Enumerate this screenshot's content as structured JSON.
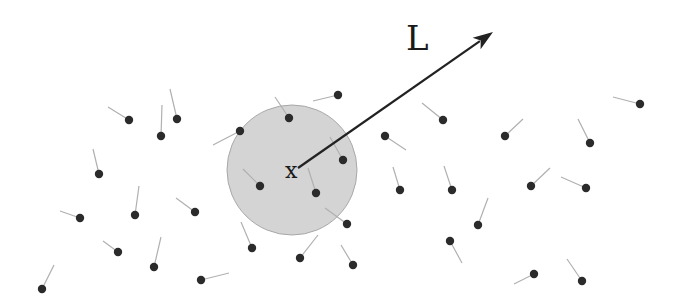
{
  "diagram": {
    "labels": {
      "vector": "L",
      "center": "x"
    },
    "colors": {
      "background": "#ffffff",
      "region_fill": "#d4d4d4",
      "region_stroke": "#a8a8a8",
      "particle": "#2b2b2b",
      "tail": "#b0b0b0",
      "arrow": "#222222"
    },
    "region": {
      "cx": 292,
      "cy": 170,
      "r": 65
    },
    "arrow": {
      "x1": 298,
      "y1": 168,
      "x2": 493,
      "y2": 32
    },
    "particles": [
      {
        "x": 129,
        "y": 120,
        "tx": 108,
        "ty": 107
      },
      {
        "x": 161,
        "y": 136,
        "tx": 162,
        "ty": 105
      },
      {
        "x": 177,
        "y": 119,
        "tx": 170,
        "ty": 89
      },
      {
        "x": 99,
        "y": 174,
        "tx": 93,
        "ty": 149
      },
      {
        "x": 80,
        "y": 218,
        "tx": 60,
        "ty": 211
      },
      {
        "x": 135,
        "y": 215,
        "tx": 139,
        "ty": 186
      },
      {
        "x": 195,
        "y": 212,
        "tx": 176,
        "ty": 198
      },
      {
        "x": 118,
        "y": 252,
        "tx": 103,
        "ty": 241
      },
      {
        "x": 154,
        "y": 267,
        "tx": 161,
        "ty": 237
      },
      {
        "x": 42,
        "y": 289,
        "tx": 54,
        "ty": 265
      },
      {
        "x": 201,
        "y": 280,
        "tx": 229,
        "ty": 273
      },
      {
        "x": 240,
        "y": 131,
        "tx": 213,
        "ty": 145
      },
      {
        "x": 289,
        "y": 118,
        "tx": 275,
        "ty": 97
      },
      {
        "x": 338,
        "y": 95,
        "tx": 313,
        "ty": 101
      },
      {
        "x": 343,
        "y": 160,
        "tx": 330,
        "ty": 137
      },
      {
        "x": 260,
        "y": 186,
        "tx": 243,
        "ty": 169
      },
      {
        "x": 316,
        "y": 193,
        "tx": 308,
        "ty": 168
      },
      {
        "x": 347,
        "y": 224,
        "tx": 325,
        "ty": 208
      },
      {
        "x": 252,
        "y": 248,
        "tx": 241,
        "ty": 222
      },
      {
        "x": 300,
        "y": 258,
        "tx": 318,
        "ty": 235
      },
      {
        "x": 353,
        "y": 265,
        "tx": 341,
        "ty": 245
      },
      {
        "x": 443,
        "y": 120,
        "tx": 422,
        "ty": 103
      },
      {
        "x": 385,
        "y": 136,
        "tx": 406,
        "ty": 150
      },
      {
        "x": 505,
        "y": 136,
        "tx": 523,
        "ty": 119
      },
      {
        "x": 590,
        "y": 143,
        "tx": 578,
        "ty": 119
      },
      {
        "x": 640,
        "y": 104,
        "tx": 613,
        "ty": 97
      },
      {
        "x": 400,
        "y": 190,
        "tx": 393,
        "ty": 167
      },
      {
        "x": 452,
        "y": 190,
        "tx": 444,
        "ty": 166
      },
      {
        "x": 531,
        "y": 186,
        "tx": 550,
        "ty": 168
      },
      {
        "x": 586,
        "y": 188,
        "tx": 561,
        "ty": 177
      },
      {
        "x": 478,
        "y": 225,
        "tx": 488,
        "ty": 198
      },
      {
        "x": 450,
        "y": 241,
        "tx": 462,
        "ty": 263
      },
      {
        "x": 534,
        "y": 274,
        "tx": 514,
        "ty": 284
      },
      {
        "x": 582,
        "y": 281,
        "tx": 567,
        "ty": 259
      }
    ]
  }
}
